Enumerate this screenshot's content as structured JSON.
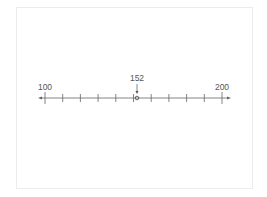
{
  "number_line": {
    "start": 100,
    "end": 200,
    "tick_step": 10,
    "start_label": "100",
    "end_label": "200",
    "marked_value": 152,
    "marked_label": "152",
    "line_color": "#555555",
    "frame_color": "#ececec"
  }
}
